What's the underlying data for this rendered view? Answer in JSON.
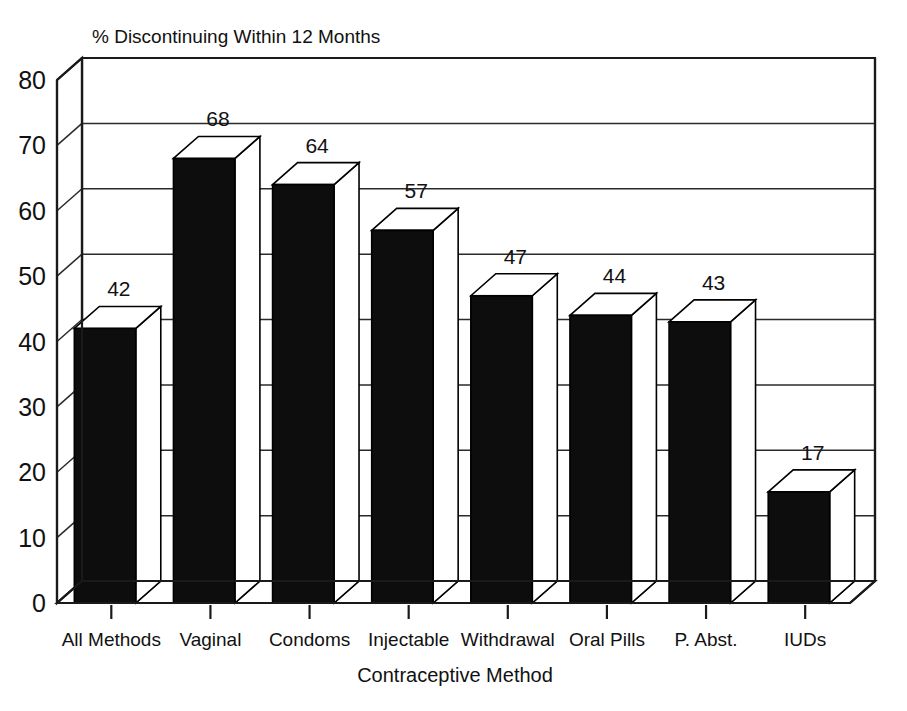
{
  "chart_data": {
    "type": "bar",
    "title": "% Discontinuing Within 12 Months",
    "xlabel": "Contraceptive Method",
    "ylabel": "",
    "categories": [
      "All Methods",
      "Vaginal",
      "Condoms",
      "Injectable",
      "Withdrawal",
      "Oral Pills",
      "P. Abst.",
      "IUDs"
    ],
    "values": [
      42,
      68,
      64,
      57,
      47,
      44,
      43,
      17
    ],
    "value_labels": [
      "42",
      "68",
      "64",
      "57",
      "47",
      "44",
      "43",
      "17"
    ],
    "ylim": [
      0,
      80
    ],
    "ytick_values": [
      0,
      10,
      20,
      30,
      40,
      50,
      60,
      70,
      80
    ],
    "ytick_labels": [
      "0",
      "10",
      "20",
      "30",
      "40",
      "50",
      "60",
      "70",
      "80"
    ],
    "grid": true,
    "grid_axis": "y",
    "legend": false,
    "style": "3d-column",
    "bar_color": "#0d0d0d",
    "bar_top_color": "#ffffff",
    "bar_side_color": "#ffffff",
    "axis_color": "#1a1a1a",
    "background_color": "#ffffff"
  }
}
